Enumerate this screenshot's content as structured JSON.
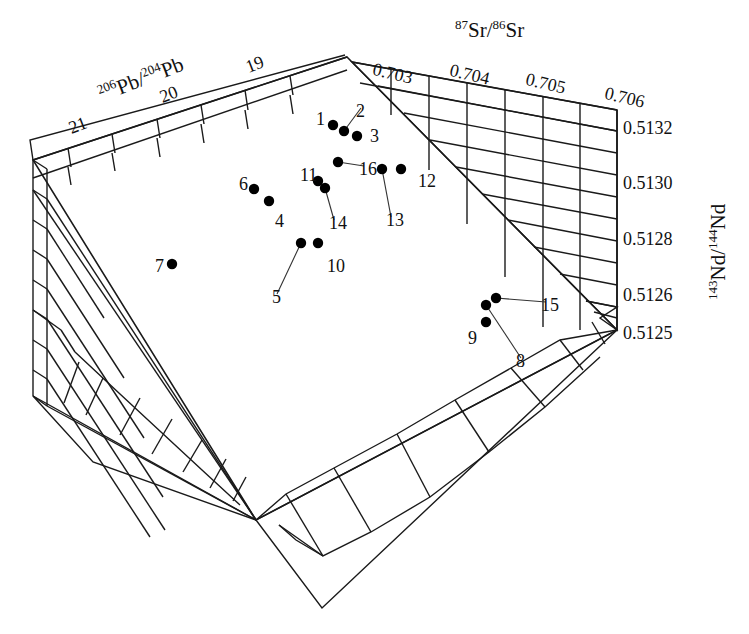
{
  "figure": {
    "kind": "3d-isotope-scatter",
    "background": "#ffffff",
    "line_color": "#1a1a1a",
    "point_color": "#000000"
  },
  "axes": {
    "pb": {
      "title_pre": "206",
      "title_mid": "Pb/",
      "title_sup2": "204",
      "title_post": "Pb",
      "ticks": [
        "21",
        "20",
        "19"
      ]
    },
    "sr": {
      "title_pre": "87",
      "title_mid": "Sr/",
      "title_sup2": "86",
      "title_post": "Sr",
      "ticks": [
        "0.703",
        "0.704",
        "0.705",
        "0.706"
      ]
    },
    "nd": {
      "title_pre": "143",
      "title_mid": "Nd/",
      "title_sup2": "144",
      "title_post": "Nd",
      "ticks": [
        "0.5132",
        "0.5130",
        "0.5128",
        "0.5126",
        "0.5125"
      ]
    }
  },
  "chart_data": {
    "type": "scatter",
    "title": "",
    "xlabel": "87Sr/86Sr",
    "ylabel": "143Nd/144Nd",
    "zlabel": "206Pb/204Pb",
    "grid": true,
    "legend": "none",
    "xlim": [
      0.7025,
      0.7062
    ],
    "ylim": [
      0.5125,
      0.51335
    ],
    "zlim": [
      18.6,
      21.4
    ],
    "xticks": [
      0.703,
      0.704,
      0.705,
      0.706
    ],
    "yticks": [
      0.5132,
      0.513,
      0.5128,
      0.5126,
      0.5125
    ],
    "zticks": [
      21,
      20,
      19
    ],
    "point_labels": [
      "1",
      "2",
      "3",
      "4",
      "5",
      "6",
      "7",
      "8",
      "9",
      "10",
      "11",
      "12",
      "13",
      "14",
      "15",
      "16"
    ],
    "points": [
      {
        "id": "1",
        "px": 333,
        "py": 125,
        "lx": 316,
        "ly": 110,
        "leader": false
      },
      {
        "id": "2",
        "px": 344,
        "py": 131,
        "lx": 356,
        "ly": 102,
        "leader": true
      },
      {
        "id": "3",
        "px": 357,
        "py": 136,
        "lx": 370,
        "ly": 127,
        "leader": false
      },
      {
        "id": "4",
        "px": 269,
        "py": 201,
        "lx": 275,
        "ly": 212,
        "leader": false
      },
      {
        "id": "5",
        "px": 301,
        "py": 243,
        "lx": 272,
        "ly": 288,
        "leader": true
      },
      {
        "id": "6",
        "px": 254,
        "py": 189,
        "lx": 239,
        "ly": 175,
        "leader": false
      },
      {
        "id": "7",
        "px": 172,
        "py": 264,
        "lx": 155,
        "ly": 257,
        "leader": false
      },
      {
        "id": "8",
        "px": 486,
        "py": 305,
        "lx": 516,
        "ly": 352,
        "leader": true
      },
      {
        "id": "9",
        "px": 486,
        "py": 322,
        "lx": 468,
        "ly": 329,
        "leader": false
      },
      {
        "id": "10",
        "px": 318,
        "py": 243,
        "lx": 327,
        "ly": 257,
        "leader": false
      },
      {
        "id": "11",
        "px": 318,
        "py": 181,
        "lx": 300,
        "ly": 166,
        "leader": false
      },
      {
        "id": "12",
        "px": 401,
        "py": 169,
        "lx": 418,
        "ly": 172,
        "leader": false
      },
      {
        "id": "13",
        "px": 382,
        "py": 169,
        "lx": 386,
        "ly": 211,
        "leader": true
      },
      {
        "id": "14",
        "px": 325,
        "py": 188,
        "lx": 329,
        "ly": 214,
        "leader": true
      },
      {
        "id": "15",
        "px": 496,
        "py": 298,
        "lx": 541,
        "ly": 296,
        "leader": true
      },
      {
        "id": "16",
        "px": 338,
        "py": 162,
        "lx": 359,
        "ly": 160,
        "leader": true
      }
    ]
  }
}
